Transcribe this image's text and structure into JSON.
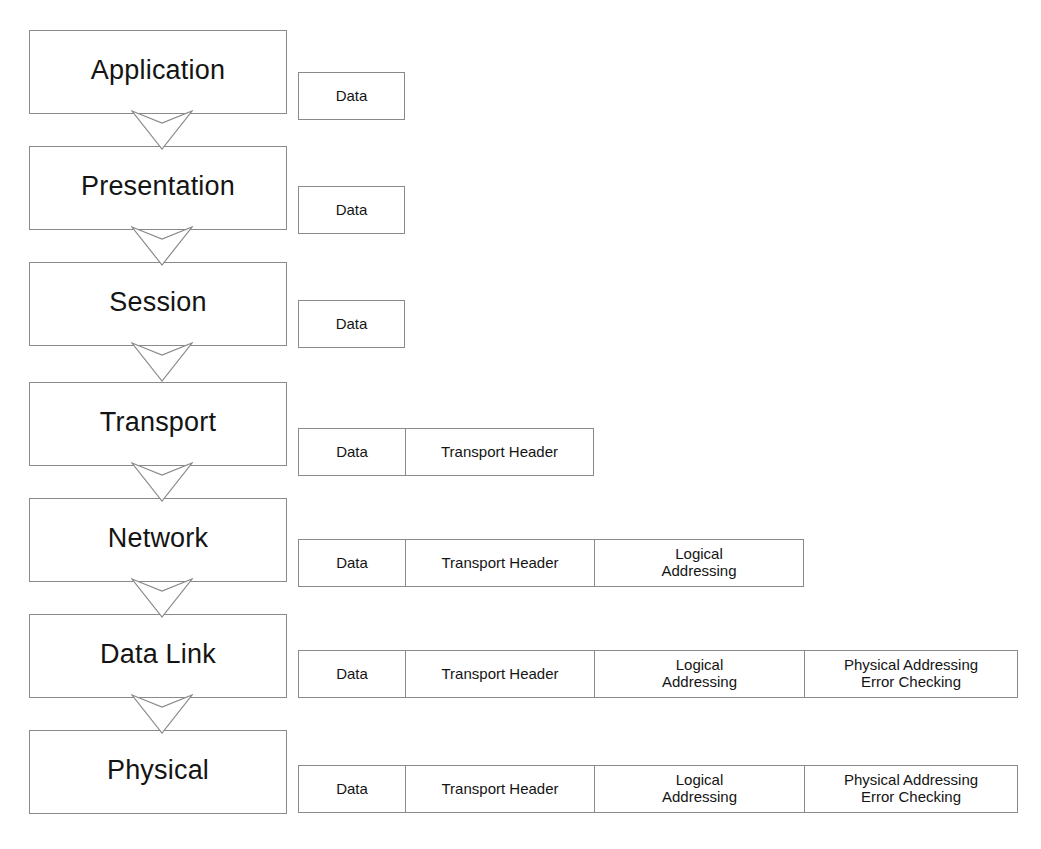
{
  "diagram": {
    "stroke_color": "#8a8a8a",
    "text_color": "#141414",
    "background": "#ffffff"
  },
  "layers": [
    {
      "name": "Application",
      "label": "Application"
    },
    {
      "name": "Presentation",
      "label": "Presentation"
    },
    {
      "name": "Session",
      "label": "Session"
    },
    {
      "name": "Transport",
      "label": "Transport"
    },
    {
      "name": "Network",
      "label": "Network"
    },
    {
      "name": "Data Link",
      "label": "Data Link"
    },
    {
      "name": "Physical",
      "label": "Physical"
    }
  ],
  "arrows": [
    {
      "from": "Application",
      "to": "Presentation",
      "shape": "chevron-down"
    },
    {
      "from": "Presentation",
      "to": "Session",
      "shape": "chevron-down"
    },
    {
      "from": "Session",
      "to": "Transport",
      "shape": "chevron-down"
    },
    {
      "from": "Transport",
      "to": "Network",
      "shape": "chevron-down"
    },
    {
      "from": "Network",
      "to": "Data Link",
      "shape": "chevron-down"
    },
    {
      "from": "Data Link",
      "to": "Physical",
      "shape": "chevron-down"
    }
  ],
  "packets": [
    {
      "layer": "Application",
      "cells": [
        {
          "label": "Data"
        }
      ]
    },
    {
      "layer": "Presentation",
      "cells": [
        {
          "label": "Data"
        }
      ]
    },
    {
      "layer": "Session",
      "cells": [
        {
          "label": "Data"
        }
      ]
    },
    {
      "layer": "Transport",
      "cells": [
        {
          "label": "Data"
        },
        {
          "label": "Transport Header"
        }
      ]
    },
    {
      "layer": "Network",
      "cells": [
        {
          "label": "Data"
        },
        {
          "label": "Transport Header"
        },
        {
          "label": "Logical\nAddressing"
        }
      ]
    },
    {
      "layer": "Data Link",
      "cells": [
        {
          "label": "Data"
        },
        {
          "label": "Transport Header"
        },
        {
          "label": "Logical\nAddressing"
        },
        {
          "label": "Physical Addressing\nError Checking"
        }
      ]
    },
    {
      "layer": "Physical",
      "cells": [
        {
          "label": "Data"
        },
        {
          "label": "Transport Header"
        },
        {
          "label": "Logical\nAddressing"
        },
        {
          "label": "Physical Addressing\nError Checking"
        }
      ]
    }
  ],
  "geometry": {
    "layer_box": {
      "left": 29,
      "width": 258,
      "height": 84
    },
    "layer_tops": [
      30,
      146,
      262,
      382,
      498,
      614,
      730
    ],
    "arrow_tops": [
      110,
      226,
      342,
      462,
      578,
      694
    ],
    "packet_tops": [
      72,
      186,
      300,
      428,
      539,
      650,
      765
    ],
    "packet_left": 298,
    "cell_widths": [
      107,
      189,
      210,
      214
    ]
  }
}
